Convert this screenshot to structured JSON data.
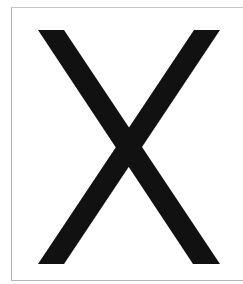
{
  "page": {
    "glyph": "X",
    "glyph_color": "#111111",
    "background_color": "#ffffff",
    "frame_color": "#b4b4b4"
  }
}
